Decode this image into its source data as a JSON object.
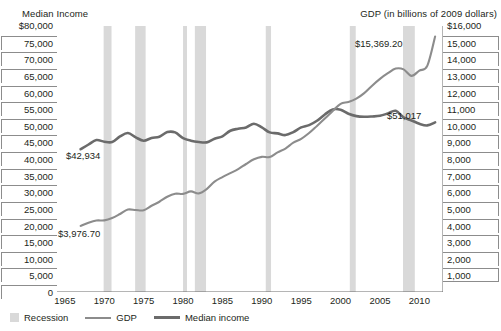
{
  "chart_data": {
    "type": "line",
    "title": "",
    "left_axis": {
      "label": "Median Income",
      "ticks": [
        "$80,000",
        "75,000",
        "70,000",
        "65,000",
        "60,000",
        "55,000",
        "50,000",
        "45,000",
        "40,000",
        "35,000",
        "30,000",
        "25,000",
        "20,000",
        "15,000",
        "10,000",
        "5,000",
        "0"
      ],
      "min": 0,
      "max": 80000,
      "step": 5000
    },
    "right_axis": {
      "label": "GDP (in billions of 2009 dollars)",
      "ticks": [
        "$16,000",
        "15,000",
        "14,000",
        "13,000",
        "12,000",
        "11,000",
        "10,000",
        "9,000",
        "8,000",
        "7,000",
        "6,000",
        "5,000",
        "4,000",
        "3,000",
        "2,000",
        "1,000"
      ],
      "min": 0,
      "max": 16000,
      "step": 1000
    },
    "xlabel": "",
    "xlim": [
      1964,
      2013
    ],
    "x_major_ticks": [
      1965,
      1970,
      1975,
      1980,
      1985,
      1990,
      1995,
      2000,
      2005,
      2010
    ],
    "x_minor_tick_interval": 1,
    "grid": false,
    "legend_position": "bottom-left",
    "legend": [
      {
        "name": "Recession",
        "type": "band",
        "color": "#d9d9d9"
      },
      {
        "name": "GDP",
        "type": "line",
        "color": "#8c8c8c"
      },
      {
        "name": "Median income",
        "type": "line",
        "color": "#6b6b6b"
      }
    ],
    "annotations": [
      {
        "text": "$42,934",
        "series": "Median income",
        "x": 1967,
        "y": 42934
      },
      {
        "text": "$3,976.70",
        "series": "GDP",
        "x": 1967,
        "y": 3976.7
      },
      {
        "text": "$15,369.20",
        "series": "GDP",
        "x": 2012,
        "y": 15369.2
      },
      {
        "text": "$51,017",
        "series": "Median income",
        "x": 2012,
        "y": 51017
      }
    ],
    "recessions": [
      {
        "start": 1969.92,
        "end": 1970.92
      },
      {
        "start": 1973.92,
        "end": 1975.25
      },
      {
        "start": 1980.0,
        "end": 1980.5
      },
      {
        "start": 1981.5,
        "end": 1982.92
      },
      {
        "start": 1990.5,
        "end": 1991.17
      },
      {
        "start": 2001.17,
        "end": 2001.92
      },
      {
        "start": 2007.92,
        "end": 2009.42
      }
    ],
    "x": [
      1967,
      1968,
      1969,
      1970,
      1971,
      1972,
      1973,
      1974,
      1975,
      1976,
      1977,
      1978,
      1979,
      1980,
      1981,
      1982,
      1983,
      1984,
      1985,
      1986,
      1987,
      1988,
      1989,
      1990,
      1991,
      1992,
      1993,
      1994,
      1995,
      1996,
      1997,
      1998,
      1999,
      2000,
      2001,
      2002,
      2003,
      2004,
      2005,
      2006,
      2007,
      2008,
      2009,
      2010,
      2011,
      2012
    ],
    "series": [
      {
        "name": "Median income",
        "axis": "left",
        "color": "#6b6b6b",
        "values": [
          42934,
          44360,
          45700,
          45200,
          45100,
          46800,
          47800,
          46500,
          45500,
          46300,
          46700,
          48100,
          48000,
          46300,
          45500,
          45100,
          45000,
          46100,
          46800,
          48500,
          49100,
          49500,
          50600,
          49500,
          48000,
          47700,
          47200,
          48100,
          49500,
          50200,
          51500,
          53400,
          54900,
          54800,
          53600,
          52900,
          52700,
          52800,
          53000,
          53700,
          54500,
          52500,
          51600,
          50600,
          50100,
          51017
        ]
      },
      {
        "name": "GDP",
        "axis": "right",
        "color": "#8c8c8c",
        "values": [
          3976.7,
          4170,
          4300,
          4310,
          4450,
          4690,
          4960,
          4930,
          4920,
          5190,
          5430,
          5730,
          5910,
          5900,
          6050,
          5930,
          6190,
          6640,
          6910,
          7150,
          7390,
          7700,
          7980,
          8130,
          8120,
          8400,
          8630,
          8980,
          9210,
          9560,
          9990,
          10430,
          10890,
          11320,
          11430,
          11630,
          11960,
          12410,
          12820,
          13160,
          13440,
          13390,
          13000,
          13320,
          13600,
          15369.2
        ]
      }
    ]
  }
}
